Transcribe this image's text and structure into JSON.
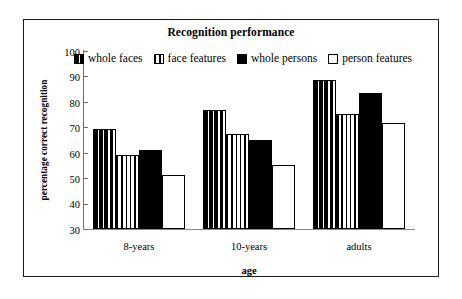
{
  "chart_data": {
    "type": "bar",
    "title": "Recognition performance",
    "xlabel": "age",
    "ylabel": "percentage correct recognition",
    "categories": [
      "8-years",
      "10-years",
      "adults"
    ],
    "ylim": [
      30,
      100
    ],
    "yticks": [
      100,
      90,
      80,
      70,
      60,
      50,
      40,
      30
    ],
    "grid": false,
    "legend_position": "top-inside",
    "series": [
      {
        "name": "whole faces",
        "pattern": "wide-vertical-stripes",
        "values": [
          69.5,
          77.0,
          88.7
        ]
      },
      {
        "name": "face features",
        "pattern": "narrow-vertical-stripes",
        "values": [
          59.0,
          67.2,
          75.2
        ]
      },
      {
        "name": "whole persons",
        "pattern": "solid-black",
        "values": [
          61.0,
          65.0,
          83.5
        ]
      },
      {
        "name": "person features",
        "pattern": "white-empty",
        "values": [
          51.4,
          55.0,
          71.5
        ]
      }
    ]
  },
  "colors": {
    "ink": "#000000",
    "axis": "#6f6f6f",
    "frame": "#1a1a1a",
    "background": "#ffffff"
  }
}
